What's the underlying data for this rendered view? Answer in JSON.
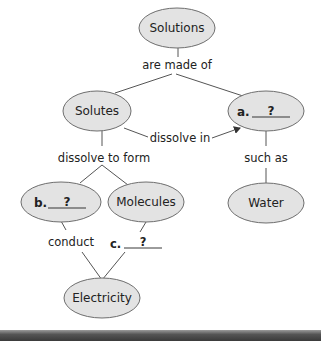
{
  "diagram": {
    "type": "concept-map",
    "colors": {
      "node_fill": "#e3e3e3",
      "node_stroke": "#6e6e6e",
      "line": "#555555",
      "bottom_bar": "#3a3a3a"
    },
    "nodes": {
      "solutions": "Solutions",
      "solutes": "Solutes",
      "a_label": "a.",
      "a_blank": "?",
      "b_label": "b.",
      "b_blank": "?",
      "molecules": "Molecules",
      "water": "Water",
      "electricity": "Electricity"
    },
    "links": {
      "are_made_of": "are made of",
      "dissolve_in": "dissolve in",
      "dissolve_to_form": "dissolve to form",
      "such_as": "such as",
      "conduct": "conduct",
      "c_label": "c.",
      "c_blank": "?"
    }
  }
}
